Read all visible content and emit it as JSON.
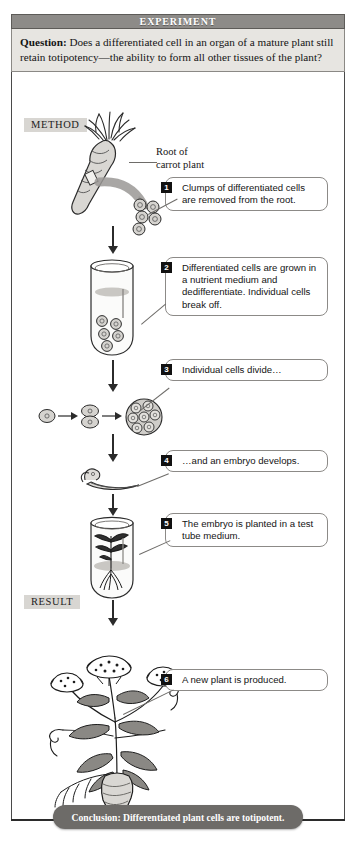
{
  "header": {
    "title": "EXPERIMENT"
  },
  "question": {
    "label": "Question:",
    "text": "Does a differentiated cell in an organ of a mature plant still retain totipotency—the ability to form all other tissues of the plant?"
  },
  "sections": {
    "method_label": "METHOD",
    "result_label": "RESULT"
  },
  "annotations": {
    "root_label": "Root of\ncarrot plant"
  },
  "steps": [
    {
      "number": "1",
      "text": "Clumps of differentiated cells are removed from the root."
    },
    {
      "number": "2",
      "text": "Differentiated cells are grown in a nutrient medium and dedifferentiate. Individual cells break off."
    },
    {
      "number": "3",
      "text": "Individual cells divide…"
    },
    {
      "number": "4",
      "text": "…and an embryo develops."
    },
    {
      "number": "5",
      "text": "The embryo is planted in a test tube medium."
    },
    {
      "number": "6",
      "text": "A new plant is produced."
    }
  ],
  "conclusion": {
    "text": "Conclusion: Differentiated plant cells are totipotent."
  },
  "figures": {
    "carrot_root": "carrot-root-illustration",
    "cell_clump": "cell-clump-illustration",
    "test_tube_cells": "test-tube-with-cells-illustration",
    "single_cell": "single-cell-illustration",
    "two_cell": "two-cell-stage-illustration",
    "cell_cluster": "cell-cluster-illustration",
    "embryo": "plant-embryo-illustration",
    "test_tube_plantlet": "test-tube-with-plantlet-illustration",
    "mature_plant": "mature-carrot-plant-illustration"
  },
  "colors": {
    "header_bar": "#8d8b88",
    "question_panel": "#e7e5e1",
    "tag_bg": "#d8d6d2",
    "conclusion_bar": "#6d6b68",
    "frame": "#4a4a4a",
    "badge": "#111111"
  }
}
